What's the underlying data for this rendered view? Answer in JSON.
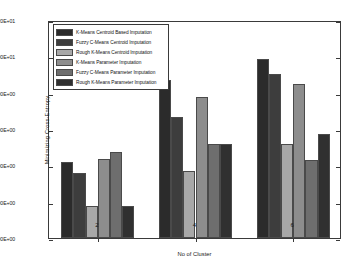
{
  "chart_data": {
    "type": "bar",
    "title": "",
    "xlabel": "No of Cluster",
    "ylabel": "Minimizing Cross-Entropy",
    "categories": [
      "2",
      "4",
      "6"
    ],
    "xtick_labels": [
      "2",
      "4",
      "6"
    ],
    "ytick_labels": [
      "0.00E+00",
      "2.00E+00",
      "4.00E+00",
      "6.00E+00",
      "8.00E+00",
      "1.00E+01",
      "1.20E+01"
    ],
    "ytick_values": [
      0,
      2,
      4,
      6,
      8,
      10,
      12
    ],
    "ylim": [
      0,
      12
    ],
    "grid": false,
    "legend_position": "upper-left-inside",
    "series": [
      {
        "name": "K-Means Centroid Based Imputation",
        "color": "#2b2b2b",
        "values": [
          4.17,
          8.7,
          9.83
        ]
      },
      {
        "name": "Fuzzy C-Means Centroid Imputation",
        "color": "#3d3d3d",
        "values": [
          3.6,
          6.65,
          9.03
        ]
      },
      {
        "name": "Rough K-Means Centroid Imputation",
        "color": "#a8a8a8",
        "values": [
          1.78,
          3.7,
          5.2
        ]
      },
      {
        "name": "K-Means Parameter Imputation",
        "color": "#8d8d8d",
        "values": [
          4.33,
          7.75,
          8.5
        ]
      },
      {
        "name": "Fuzzy C-Means Parameter Imputation",
        "color": "#6e6e6e",
        "values": [
          4.76,
          5.2,
          4.3
        ]
      },
      {
        "name": "Rough K-Means Parameter Imputation",
        "color": "#303030",
        "values": [
          1.78,
          5.15,
          5.7
        ]
      }
    ]
  }
}
